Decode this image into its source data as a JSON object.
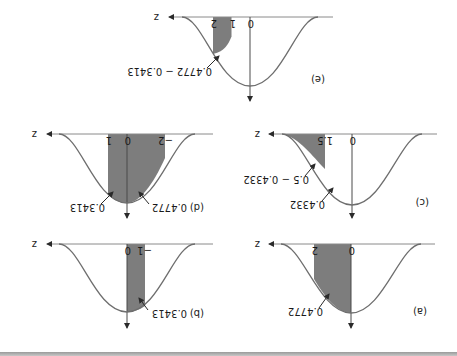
{
  "figure": {
    "orientation": "rotated-180",
    "axis_symbol": "z",
    "colors": {
      "curve": "#6e6e6e",
      "axis": "#8a8a8a",
      "shade": "#7d7d7d",
      "text": "#1a1a1a",
      "arrow": "#2a2a2a",
      "bottom_band": "#a8a8a8"
    },
    "panels": [
      {
        "id": "a",
        "label": "(a)",
        "shaded_from_z": 0,
        "shaded_to_z": 2,
        "tick_labels": [
          "0",
          "2"
        ],
        "annotations": [
          "0.4772"
        ]
      },
      {
        "id": "b",
        "label": "(b)",
        "shaded_from_z": -1,
        "shaded_to_z": 0,
        "tick_labels": [
          "−1",
          "0"
        ],
        "annotations": [
          "0.3413"
        ]
      },
      {
        "id": "c",
        "label": "(c)",
        "shaded_from_z": 1.5,
        "shaded_to_z": "inf",
        "tick_labels": [
          "0",
          "1.5"
        ],
        "annotations": [
          "0.4332",
          "0.5 − 0.4332"
        ]
      },
      {
        "id": "d",
        "label": "(d)",
        "shaded_from_z": -2,
        "shaded_to_z": 1,
        "tick_labels": [
          "−2",
          "0",
          "1"
        ],
        "annotations": [
          "0.4772",
          "0.3413"
        ]
      },
      {
        "id": "e",
        "label": "(e)",
        "shaded_from_z": 1,
        "shaded_to_z": 2,
        "tick_labels": [
          "0",
          "1",
          "2"
        ],
        "annotations": [
          "0.4772 − 0.3413"
        ]
      }
    ]
  }
}
